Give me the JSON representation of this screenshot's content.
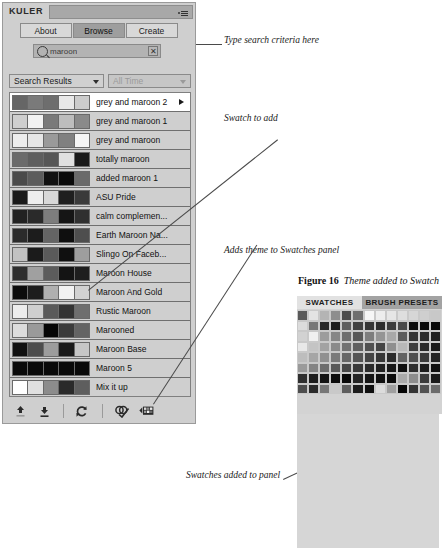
{
  "panel": {
    "title": "KULER",
    "menu_icon": "panel-menu-icon",
    "tabs": [
      {
        "label": "About",
        "active": false
      },
      {
        "label": "Browse",
        "active": true
      },
      {
        "label": "Create",
        "active": false
      }
    ],
    "search": {
      "icon": "search-icon",
      "value": "maroon",
      "placeholder": "Search",
      "clear_label": "✕"
    },
    "filters": [
      {
        "label": "Search Results",
        "muted": false
      },
      {
        "label": "All Time",
        "muted": true
      }
    ],
    "themes": [
      {
        "name": "grey and maroon 2",
        "selected": true,
        "has_arrow": true,
        "colors": [
          "#666666",
          "#7a7a7a",
          "#6e6e6e",
          "#e8e8e8",
          "#cccccc"
        ]
      },
      {
        "name": "grey and maroon 1",
        "selected": false,
        "has_arrow": false,
        "colors": [
          "#cfcfcf",
          "#f2f2f2",
          "#7a7a7a",
          "#bdbdbd",
          "#8a8a8a"
        ]
      },
      {
        "name": "grey and maroon",
        "selected": false,
        "has_arrow": false,
        "colors": [
          "#ededed",
          "#e6e6e6",
          "#9a9a9a",
          "#808080",
          "#f5f5f5"
        ]
      },
      {
        "name": "totally maroon",
        "selected": false,
        "has_arrow": false,
        "colors": [
          "#6b6b6b",
          "#5e5e5e",
          "#565656",
          "#e0e0e0",
          "#1a1a1a"
        ]
      },
      {
        "name": "added maroon 1",
        "selected": false,
        "has_arrow": false,
        "colors": [
          "#4a4a4a",
          "#5c5c5c",
          "#111111",
          "#0a0a0a",
          "#6a6a6a"
        ]
      },
      {
        "name": "ASU Pride",
        "selected": false,
        "has_arrow": false,
        "colors": [
          "#1a1a1a",
          "#ededed",
          "#d8d8d8",
          "#1f1f1f",
          "#3a3a3a"
        ]
      },
      {
        "name": "calm complemen...",
        "selected": false,
        "has_arrow": false,
        "colors": [
          "#222222",
          "#2a2a2a",
          "#7d7d7d",
          "#151515",
          "#303030"
        ]
      },
      {
        "name": "Earth Maroon Na...",
        "selected": false,
        "has_arrow": false,
        "colors": [
          "#2b2b2b",
          "#1c1c1c",
          "#646464",
          "#0f0f0f",
          "#4e4e4e"
        ]
      },
      {
        "name": "Slingo On Faceb...",
        "selected": false,
        "has_arrow": false,
        "colors": [
          "#c2c2c2",
          "#1b1b1b",
          "#5a5a5a",
          "#101010",
          "#9e9e9e"
        ]
      },
      {
        "name": "Maroon House",
        "selected": false,
        "has_arrow": false,
        "colors": [
          "#2e2e2e",
          "#a0a0a0",
          "#5c5c5c",
          "#141414",
          "#1e1e1e"
        ]
      },
      {
        "name": "Maroon And Gold",
        "selected": false,
        "has_arrow": false,
        "colors": [
          "#0c0c0c",
          "#1d1d1d",
          "#b0b0b0",
          "#f2f2f2",
          "#d2d2d2"
        ]
      },
      {
        "name": "Rustic Maroon",
        "selected": false,
        "has_arrow": false,
        "colors": [
          "#ededed",
          "#cfcfcf",
          "#5a5a5a",
          "#333333",
          "#6e6e6e"
        ]
      },
      {
        "name": "Marooned",
        "selected": false,
        "has_arrow": false,
        "colors": [
          "#dcdcdc",
          "#9a9a9a",
          "#060606",
          "#3b3b3b",
          "#646464"
        ]
      },
      {
        "name": "Maroon Base",
        "selected": false,
        "has_arrow": false,
        "colors": [
          "#101010",
          "#4c4c4c",
          "#9c9c9c",
          "#1a1a1a",
          "#c6c6c6"
        ]
      },
      {
        "name": "Maroon 5",
        "selected": false,
        "has_arrow": false,
        "colors": [
          "#0a0a0a",
          "#0a0a0a",
          "#0a0a0a",
          "#0a0a0a",
          "#0a0a0a"
        ]
      },
      {
        "name": "Mix it up",
        "selected": false,
        "has_arrow": false,
        "colors": [
          "#ffffff",
          "#e0e0e0",
          "#8c8c8c",
          "#2a2a2a",
          "#5e5e5e"
        ]
      }
    ],
    "footer_buttons": [
      {
        "icon": "upload-arrow-icon",
        "label": "Upload theme"
      },
      {
        "icon": "download-arrow-icon",
        "label": "Download theme"
      },
      {
        "icon": "refresh-icon",
        "label": "Refresh"
      },
      {
        "icon": "edit-theme-icon",
        "label": "Edit theme"
      },
      {
        "icon": "add-to-swatches-icon",
        "label": "Add theme to Swatches panel"
      }
    ]
  },
  "annotations": [
    {
      "id": "anno-search",
      "text": "Type search criteria here"
    },
    {
      "id": "anno-swatch",
      "text": "Swatch to add"
    },
    {
      "id": "anno-adds-theme",
      "text": "Adds theme to Swatches panel"
    },
    {
      "id": "anno-swatches-added",
      "text": "Swatches added to panel"
    }
  ],
  "figure": {
    "number": "Figure 16",
    "caption": "Theme added to Swatch"
  },
  "swatches_panel": {
    "tabs": [
      {
        "label": "SWATCHES",
        "active": true
      },
      {
        "label": "BRUSH PRESETS",
        "active": false
      }
    ],
    "grid": [
      "#5a5a5a",
      "#e3e3e3",
      "#b4b4b4",
      "#8e8e8e",
      "#4c4c4c",
      "#6f6f6f",
      "#f6f6f6",
      "#ededed",
      "#e6e6e6",
      "#dedede",
      "#d6d6d6",
      "#cfcfcf",
      "#c8c8c8",
      "#dcdcdc",
      "#777777",
      "#2a2a2a",
      "#1e1e1e",
      "#5f5f5f",
      "#414141",
      "#353535",
      "#2d2d2d",
      "#3c3c3c",
      "#4a4a4a",
      "#0d0d0d",
      "#0a0a0a",
      "#080808",
      "#d2d2d2",
      "#f0f0f0",
      "#9c9c9c",
      "#868686",
      "#6e6e6e",
      "#585858",
      "#7d7d7d",
      "#949494",
      "#a8a8a8",
      "#5b5b5b",
      "#333333",
      "#2b2b2b",
      "#1f1f1f",
      "#e8e8e8",
      "#c4c4c4",
      "#a2a2a2",
      "#8a8a8a",
      "#727272",
      "#606060",
      "#515151",
      "#464646",
      "#8f8f8f",
      "#b8b8b8",
      "#3e3e3e",
      "#2a2a2a",
      "#191919",
      "#bdbdbd",
      "#a6a6a6",
      "#909090",
      "#7b7b7b",
      "#676767",
      "#555555",
      "#454545",
      "#373737",
      "#2b2b2b",
      "#636363",
      "#4f4f4f",
      "#3a3a3a",
      "#242424",
      "#9a9a9a",
      "#848484",
      "#6d6d6d",
      "#5a5a5a",
      "#484848",
      "#393939",
      "#2c2c2c",
      "#212121",
      "#171717",
      "#0f0f0f",
      "#2e2e2e",
      "#1b1b1b",
      "#111111",
      "#2f2f2f",
      "#1d1d1d",
      "#141414",
      "#0c0c0c",
      "#090909",
      "#242424",
      "#151515",
      "#101010",
      "#0b0b0b",
      "#a9a9a9",
      "#8d8d8d",
      "#3b3b3b",
      "#1a1a1a",
      "#4d4d4d",
      "#2b2b2b",
      "#777777",
      "#c9c9c9",
      "#5e5e5e",
      "#1c1c1c",
      "#0e0e0e",
      "#dcdcdc",
      "#9f9f9f",
      "#060606",
      "#343434",
      "#525252",
      "#6b6b6b"
    ]
  }
}
